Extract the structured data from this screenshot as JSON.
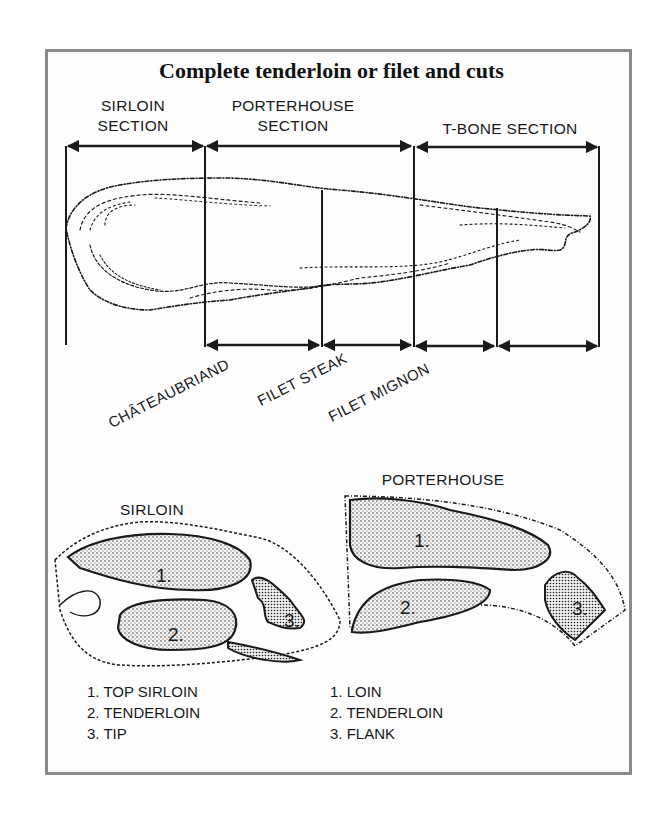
{
  "title": "Complete tenderloin or filet and cuts",
  "sections": [
    {
      "id": "sirloin",
      "line1": "SIRLOIN",
      "line2": "SECTION"
    },
    {
      "id": "porterhouse",
      "line1": "PORTERHOUSE",
      "line2": "SECTION"
    },
    {
      "id": "tbone",
      "line1": "T-BONE SECTION"
    }
  ],
  "cuts": [
    "CHÂTEAUBRIAND",
    "FILET STEAK",
    "FILET MIGNON"
  ],
  "cross_sections": {
    "sirloin": {
      "title": "SIRLOIN",
      "markers": [
        "1.",
        "2.",
        "3."
      ],
      "legend": [
        "1. TOP SIRLOIN",
        "2. TENDERLOIN",
        "3. TIP"
      ]
    },
    "porterhouse": {
      "title": "PORTERHOUSE",
      "markers": [
        "1.",
        "2.",
        "3."
      ],
      "legend": [
        "1. LOIN",
        "2. TENDERLOIN",
        "3. FLANK"
      ]
    }
  },
  "colors": {
    "frame": "#8a8a8a",
    "ink": "#1a1a1a",
    "background": "#ffffff"
  }
}
